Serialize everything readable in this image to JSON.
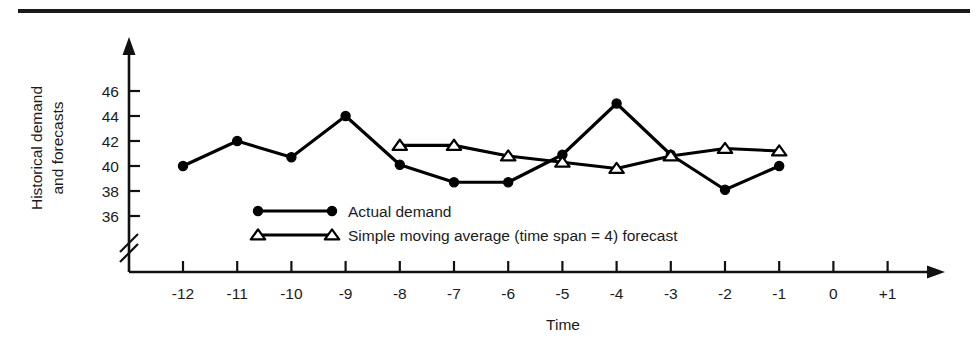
{
  "figure": {
    "has_top_rule": true,
    "background_color": "#ffffff",
    "ink_color": "#000000"
  },
  "chart_data": {
    "type": "line",
    "title": "",
    "xlabel": "Time",
    "ylabel": "Historical demand and forecasts",
    "ylabel_line1": "Historical demand",
    "ylabel_line2": "and forecasts",
    "x": [
      -12,
      -11,
      -10,
      -9,
      -8,
      -7,
      -6,
      -5,
      -4,
      -3,
      -2,
      -1
    ],
    "xticks": [
      "-12",
      "-11",
      "-10",
      "-9",
      "-8",
      "-7",
      "-6",
      "-5",
      "-4",
      "-3",
      "-2",
      "-1",
      "0",
      "+1"
    ],
    "xtick_values": [
      -12,
      -11,
      -10,
      -9,
      -8,
      -7,
      -6,
      -5,
      -4,
      -3,
      -2,
      -1,
      0,
      1
    ],
    "yticks": [
      36,
      38,
      40,
      42,
      44,
      46
    ],
    "ytick_labels": [
      "36",
      "38",
      "40",
      "42",
      "44",
      "46"
    ],
    "ylim": [
      35.0,
      47.0
    ],
    "xlim": [
      -13.0,
      2.0
    ],
    "y_axis_break": true,
    "grid": false,
    "legend_position": "inside-lower-center",
    "series": [
      {
        "name": "Actual demand",
        "marker": "filled-circle",
        "x": [
          -12,
          -11,
          -10,
          -9,
          -8,
          -7,
          -6,
          -5,
          -4,
          -3,
          -2,
          -1
        ],
        "values": [
          40.0,
          42.0,
          40.7,
          44.0,
          40.1,
          38.7,
          38.7,
          40.9,
          45.0,
          40.9,
          38.1,
          40.0
        ]
      },
      {
        "name": "Simple moving average (time span = 4) forecast",
        "marker": "open-triangle",
        "x": [
          -8,
          -7,
          -6,
          -5,
          -4,
          -3,
          -2,
          -1
        ],
        "values": [
          41.65,
          41.65,
          40.8,
          40.3,
          39.8,
          40.8,
          41.4,
          41.2
        ]
      }
    ]
  },
  "legend": {
    "items": [
      {
        "label": "Actual demand",
        "marker": "filled-circle"
      },
      {
        "label": "Simple moving average (time span = 4) forecast",
        "marker": "open-triangle"
      }
    ]
  }
}
